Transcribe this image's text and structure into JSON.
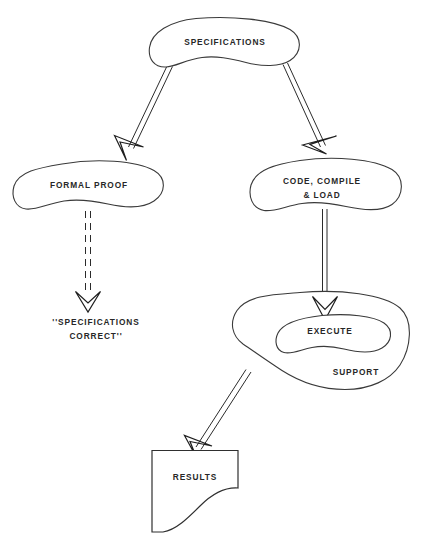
{
  "diagram": {
    "background_color": "#ffffff",
    "line_color": "#2b2b2b",
    "text_color": "#272727",
    "nodes": {
      "specifications": {
        "label": "SPECIFICATIONS",
        "shape": "blob"
      },
      "formal_proof": {
        "label": "FORMAL PROOF",
        "shape": "blob"
      },
      "code_compile": {
        "label_line1": "CODE, COMPILE",
        "label_line2": "& LOAD",
        "shape": "blob"
      },
      "support": {
        "label": "SUPPORT",
        "shape": "blob"
      },
      "execute": {
        "label": "EXECUTE",
        "shape": "blob"
      },
      "results": {
        "label": "RESULTS",
        "shape": "document"
      },
      "specifications_correct": {
        "label_line1": "''SPECIFICATIONS",
        "label_line2": "CORRECT''",
        "shape": "text"
      }
    },
    "edges": [
      {
        "name": "specifications-to-formal-proof",
        "style": "solid-double-line",
        "head": "open-v"
      },
      {
        "name": "specifications-to-code-compile",
        "style": "solid-double-line",
        "head": "open-v"
      },
      {
        "name": "formal-proof-to-specifications-correct",
        "style": "dashed-double-line",
        "head": "open-v"
      },
      {
        "name": "code-compile-to-execute",
        "style": "solid-double-line",
        "head": "open-v"
      },
      {
        "name": "support-to-results",
        "style": "solid-double-line",
        "head": "open-v"
      }
    ]
  }
}
